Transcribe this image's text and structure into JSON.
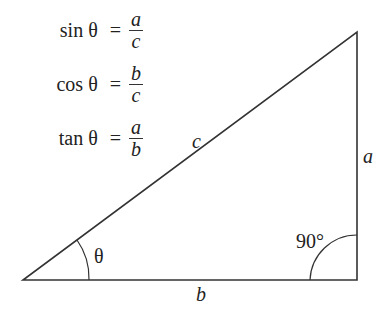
{
  "formulas": [
    {
      "fn": "sin θ",
      "eq": "=",
      "num": "a",
      "den": "c"
    },
    {
      "fn": "cos θ",
      "eq": "=",
      "num": "b",
      "den": "c"
    },
    {
      "fn": "tan θ",
      "eq": "=",
      "num": "a",
      "den": "b"
    }
  ],
  "triangle": {
    "hypotenuse_label": "c",
    "opposite_label": "a",
    "adjacent_label": "b",
    "angle_label": "θ",
    "right_angle_label": "90°"
  }
}
